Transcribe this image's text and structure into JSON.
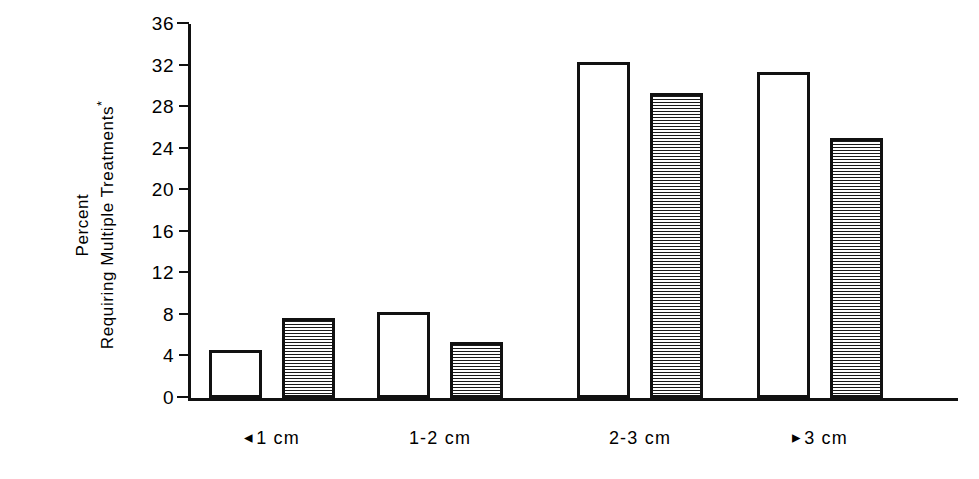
{
  "chart_data": {
    "type": "bar",
    "title": "",
    "xlabel": "",
    "ylabel_line1": "Percent",
    "ylabel_line2": "Requiring Multiple Treatments",
    "ylabel_superscript": "*",
    "categories": [
      "<1 cm",
      "1-2 cm",
      "2-3 cm",
      ">3 cm"
    ],
    "category_prefixes": [
      "◂",
      "",
      "",
      "▸"
    ],
    "category_texts": [
      "1 cm",
      "1-2 cm",
      "2-3 cm",
      "3 cm"
    ],
    "series": [
      {
        "name": "open",
        "fill": "white",
        "values": [
          4.6,
          8.3,
          32.3,
          31.4
        ]
      },
      {
        "name": "hatched",
        "fill": "horizontal-hatch",
        "values": [
          7.7,
          5.4,
          29.4,
          25.0
        ]
      }
    ],
    "ylim": [
      0,
      36
    ],
    "yticks": [
      0,
      4,
      8,
      12,
      16,
      20,
      24,
      28,
      32,
      36
    ],
    "ytick_labels": [
      "0",
      "4",
      "8",
      "12",
      "16",
      "20",
      "24",
      "28",
      "32",
      "36"
    ],
    "grid": false,
    "legend": "none"
  },
  "colors": {
    "ink": "#111111",
    "background": "#ffffff",
    "hatch": "#1a1a1a"
  }
}
